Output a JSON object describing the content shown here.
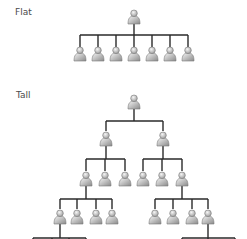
{
  "sections": [
    {
      "label": "Flat"
    },
    {
      "label": "Tall"
    }
  ],
  "style": {
    "line_color": "#2a2a2a",
    "person_light": "#f2f2f2",
    "person_dark": "#8c8c8c",
    "person_outline": "#7a7a7a"
  },
  "flat": {
    "root": {
      "x": 134,
      "y": 10
    },
    "bar": {
      "y": 35,
      "x1": 80,
      "x2": 188
    },
    "children_x": [
      80,
      98,
      116,
      134,
      152,
      170,
      188
    ],
    "children_y": 47
  },
  "tall": {
    "nodes": [
      {
        "x": 134,
        "y": 95
      },
      {
        "x": 106,
        "y": 132
      },
      {
        "x": 163,
        "y": 132
      },
      {
        "x": 86,
        "y": 172
      },
      {
        "x": 105,
        "y": 172
      },
      {
        "x": 125,
        "y": 172
      },
      {
        "x": 143,
        "y": 172
      },
      {
        "x": 162,
        "y": 172
      },
      {
        "x": 182,
        "y": 172
      },
      {
        "x": 60,
        "y": 210
      },
      {
        "x": 77,
        "y": 210
      },
      {
        "x": 96,
        "y": 210
      },
      {
        "x": 112,
        "y": 210
      },
      {
        "x": 155,
        "y": 210
      },
      {
        "x": 173,
        "y": 210
      },
      {
        "x": 192,
        "y": 210
      },
      {
        "x": 208,
        "y": 210
      }
    ],
    "groups": [
      {
        "parent_x": 134,
        "parent_bottom": 109,
        "bar_y": 121,
        "children_x": [
          106,
          163
        ],
        "child_top": 131
      },
      {
        "parent_x": 106,
        "parent_bottom": 146,
        "bar_y": 159,
        "children_x": [
          86,
          105,
          125
        ],
        "child_top": 171
      },
      {
        "parent_x": 163,
        "parent_bottom": 146,
        "bar_y": 159,
        "children_x": [
          143,
          162,
          182
        ],
        "child_top": 171
      },
      {
        "parent_x": 86,
        "parent_bottom": 186,
        "bar_y": 199,
        "children_x": [
          60,
          77,
          96,
          112
        ],
        "child_top": 209
      },
      {
        "parent_x": 182,
        "parent_bottom": 186,
        "bar_y": 199,
        "children_x": [
          155,
          173,
          192,
          208
        ],
        "child_top": 209
      },
      {
        "parent_x": 60,
        "parent_bottom": 224,
        "bar_y": 238,
        "children_x": [
          33,
          52,
          69,
          86
        ],
        "child_top": 242
      },
      {
        "parent_x": 208,
        "parent_bottom": 224,
        "bar_y": 238,
        "children_x": [
          182,
          208,
          235
        ],
        "child_top": 242
      }
    ]
  }
}
